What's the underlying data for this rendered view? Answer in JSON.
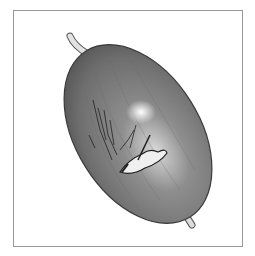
{
  "image": {
    "subject": "fruit-illustration",
    "style": "grayscale pencil drawing",
    "colors": {
      "frame": "#9a9a9a",
      "background": "#ffffff",
      "fruit_body": "#7d7d7d",
      "fruit_dark": "#4a4a4a",
      "highlight": "#f4f4f4",
      "stem": "#dcdcdc"
    }
  }
}
